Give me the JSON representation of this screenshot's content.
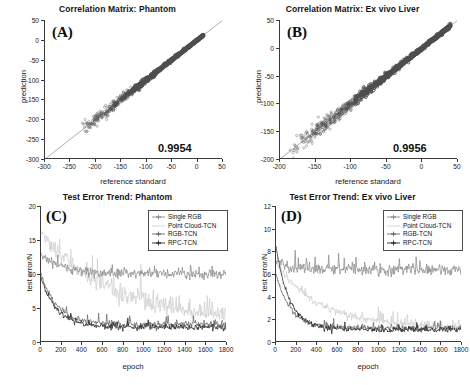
{
  "figure": {
    "background": "#ffffff",
    "panels": [
      "A",
      "B",
      "C",
      "D"
    ]
  },
  "panelA": {
    "letter": "(A)",
    "title": "Correlation Matrix: Phantom",
    "xlabel": "reference standard",
    "ylabel": "prediction",
    "corr_label": "0.9954"
  },
  "panelB": {
    "letter": "(B)",
    "title": "Correlation Matrix: Ex vivo Liver",
    "xlabel": "reference standard",
    "ylabel": "prediction",
    "corr_label": "0.9956"
  },
  "panelC": {
    "letter": "(C)",
    "title": "Test Error Trend: Phantom",
    "xlabel": "epoch",
    "ylabel": "test error/N"
  },
  "panelD": {
    "letter": "(D)",
    "title": "Test Error Trend: Ex vivo Liver",
    "xlabel": "epoch",
    "ylabel": "test error/N"
  },
  "legend": {
    "entries": [
      {
        "label": "Single RGB",
        "color": "#8c8c8c",
        "marker": "plus"
      },
      {
        "label": "Point Cloud-TCN",
        "color": "#cfcfcf",
        "marker": "none"
      },
      {
        "label": "RGB-TCN",
        "color": "#6b6b6b",
        "marker": "plus"
      },
      {
        "label": "RPC-TCN",
        "color": "#2b2b2b",
        "marker": "plus"
      }
    ]
  },
  "chart_data": [
    {
      "id": "A",
      "type": "scatter",
      "title": "Correlation Matrix: Phantom",
      "xlabel": "reference standard",
      "ylabel": "prediction",
      "xlim": [
        -300,
        50
      ],
      "ylim": [
        -300,
        50
      ],
      "xticks": [
        -300,
        -250,
        -200,
        -150,
        -100,
        -50,
        0,
        50
      ],
      "yticks": [
        -300,
        -250,
        -200,
        -150,
        -100,
        -50,
        0,
        50
      ],
      "grid": false,
      "annotation": "0.9954",
      "correlation": 0.9954,
      "identity_line": true,
      "marker_color": "#4d4d4d",
      "point_density_note": "dense cloud along y=x, densest between -120 and 10, sparse scatter with larger spread below -150",
      "points_summary": {
        "n_points_approx": 1400,
        "x_range_observed": [
          -230,
          12
        ],
        "y_range_observed": [
          -262,
          18
        ],
        "slope": 1.0,
        "intercept": 0
      }
    },
    {
      "id": "B",
      "type": "scatter",
      "title": "Correlation Matrix: Ex vivo Liver",
      "xlabel": "reference standard",
      "ylabel": "prediction",
      "xlim": [
        -200,
        50
      ],
      "ylim": [
        -200,
        50
      ],
      "xticks": [
        -200,
        -150,
        -100,
        -50,
        0,
        50
      ],
      "yticks": [
        -200,
        -150,
        -100,
        -50,
        0,
        50
      ],
      "grid": false,
      "annotation": "0.9956",
      "correlation": 0.9956,
      "identity_line": true,
      "marker_color": "#4d4d4d",
      "point_density_note": "dense cloud along y=x, densest between -110 and 35, sparse tail toward -190",
      "points_summary": {
        "n_points_approx": 1400,
        "x_range_observed": [
          -192,
          40
        ],
        "y_range_observed": [
          -196,
          36
        ],
        "slope": 1.0,
        "intercept": 0
      }
    },
    {
      "id": "C",
      "type": "line",
      "title": "Test Error Trend: Phantom",
      "xlabel": "epoch",
      "ylabel": "test error/N",
      "xlim": [
        0,
        1800
      ],
      "ylim": [
        0,
        20
      ],
      "xticks": [
        0,
        200,
        400,
        600,
        800,
        1000,
        1200,
        1400,
        1600,
        1800
      ],
      "yticks": [
        0,
        5,
        10,
        15,
        20
      ],
      "grid": false,
      "legend_position": "top-right",
      "series": [
        {
          "name": "Single RGB",
          "color": "#8c8c8c",
          "plateau": 10.0,
          "noise_amplitude": 0.9,
          "start": 13.0,
          "decay_epochs": 180,
          "values_at": {
            "0": 13.0,
            "100": 11.5,
            "200": 10.6,
            "400": 10.2,
            "600": 10.1,
            "800": 10.0,
            "1000": 10.0,
            "1200": 10.0,
            "1400": 10.0,
            "1600": 9.9,
            "1800": 9.8
          }
        },
        {
          "name": "Point Cloud-TCN",
          "color": "#cfcfcf",
          "plateau": 3.0,
          "noise_amplitude": 1.8,
          "start": 16.0,
          "decay_epochs": 700,
          "values_at": {
            "0": 16.0,
            "100": 12.5,
            "200": 10.5,
            "400": 8.0,
            "600": 6.0,
            "800": 4.5,
            "1000": 3.6,
            "1200": 3.2,
            "1400": 3.1,
            "1600": 3.0,
            "1800": 3.0
          }
        },
        {
          "name": "RGB-TCN",
          "color": "#6b6b6b",
          "plateau": 2.6,
          "noise_amplitude": 0.6,
          "start": 10.0,
          "decay_epochs": 160,
          "values_at": {
            "0": 10.0,
            "100": 4.6,
            "200": 3.6,
            "400": 3.1,
            "600": 2.9,
            "800": 2.8,
            "1000": 2.8,
            "1200": 2.7,
            "1400": 2.7,
            "1600": 2.6,
            "1800": 2.6
          }
        },
        {
          "name": "RPC-TCN",
          "color": "#2b2b2b",
          "plateau": 2.2,
          "noise_amplitude": 0.55,
          "start": 9.5,
          "decay_epochs": 150,
          "values_at": {
            "0": 9.5,
            "100": 4.2,
            "200": 3.2,
            "400": 2.7,
            "600": 2.5,
            "800": 2.4,
            "1000": 2.3,
            "1200": 2.3,
            "1400": 2.2,
            "1600": 2.2,
            "1800": 2.1
          }
        }
      ]
    },
    {
      "id": "D",
      "type": "line",
      "title": "Test Error Trend: Ex vivo Liver",
      "xlabel": "epoch",
      "ylabel": "test error/N",
      "xlim": [
        0,
        1800
      ],
      "ylim": [
        0,
        12
      ],
      "xticks": [
        0,
        200,
        400,
        600,
        800,
        1000,
        1200,
        1400,
        1600,
        1800
      ],
      "yticks": [
        0,
        2,
        4,
        6,
        8,
        10,
        12
      ],
      "grid": false,
      "legend_position": "top-right",
      "series": [
        {
          "name": "Single RGB",
          "color": "#8c8c8c",
          "plateau": 6.4,
          "noise_amplitude": 0.6,
          "start": 7.2,
          "decay_epochs": 120,
          "values_at": {
            "0": 7.2,
            "100": 6.8,
            "200": 6.6,
            "400": 6.5,
            "600": 6.5,
            "800": 6.4,
            "1000": 6.4,
            "1200": 6.4,
            "1400": 6.4,
            "1600": 6.3,
            "1800": 6.3
          }
        },
        {
          "name": "Point Cloud-TCN",
          "color": "#cfcfcf",
          "plateau": 1.3,
          "noise_amplitude": 0.45,
          "start": 7.0,
          "decay_epochs": 420,
          "values_at": {
            "0": 7.0,
            "100": 5.6,
            "200": 4.6,
            "400": 3.2,
            "600": 2.3,
            "800": 1.9,
            "1000": 1.6,
            "1200": 1.5,
            "1400": 1.4,
            "1600": 1.3,
            "1800": 1.3
          }
        },
        {
          "name": "RGB-TCN",
          "color": "#6b6b6b",
          "plateau": 1.25,
          "noise_amplitude": 0.3,
          "start": 6.0,
          "decay_epochs": 140,
          "values_at": {
            "0": 6.0,
            "100": 2.6,
            "200": 2.0,
            "400": 1.7,
            "600": 1.5,
            "800": 1.4,
            "1000": 1.35,
            "1200": 1.3,
            "1400": 1.3,
            "1600": 1.25,
            "1800": 1.2
          }
        },
        {
          "name": "RPC-TCN",
          "color": "#2b2b2b",
          "plateau": 1.1,
          "noise_amplitude": 0.3,
          "start": 8.4,
          "decay_epochs": 130,
          "values_at": {
            "0": 8.4,
            "100": 2.6,
            "200": 1.9,
            "400": 1.6,
            "600": 1.4,
            "800": 1.3,
            "1000": 1.2,
            "1200": 1.15,
            "1400": 1.1,
            "1600": 1.1,
            "1800": 1.05
          }
        }
      ]
    }
  ]
}
